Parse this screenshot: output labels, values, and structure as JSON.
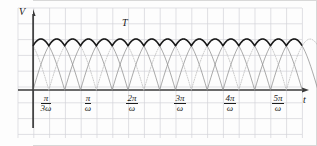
{
  "figure": {
    "background_color": "#fdfdfd",
    "frame_color": "#d8d8d8",
    "grid_color": "#d3d3d8",
    "axis_color": "#3a3a3a",
    "envelope_color": "#1a1a1a",
    "arch_color": "#8e8e8e",
    "dotted_color": "#b5b5b5"
  },
  "axes": {
    "y_label": "V",
    "x_label": "t",
    "period_label": "T"
  },
  "ticks": [
    {
      "id": "tick-pi-over-3w",
      "numerator": "π",
      "denominator": "3ω",
      "x": 46
    },
    {
      "id": "tick-pi-over-w",
      "numerator": "π",
      "denominator": "ω",
      "x": 88
    },
    {
      "id": "tick-2pi-over-w",
      "numerator": "2π",
      "denominator": "ω",
      "x": 132
    },
    {
      "id": "tick-3pi-over-w",
      "numerator": "3π",
      "denominator": "ω",
      "x": 180
    },
    {
      "id": "tick-4pi-over-w",
      "numerator": "4π",
      "denominator": "ω",
      "x": 230
    },
    {
      "id": "tick-5pi-over-w",
      "numerator": "5π",
      "denominator": "ω",
      "x": 278
    }
  ],
  "chart_data": {
    "type": "line",
    "title": "",
    "xlabel": "t",
    "ylabel": "V",
    "grid": true,
    "legend": "none",
    "xlim": [
      0,
      5.6
    ],
    "ylim": [
      0,
      1.15
    ],
    "x_unit": "pi/omega",
    "xticks": [
      0.3333,
      1,
      2,
      3,
      4,
      5
    ],
    "xticklabels": [
      "π/3ω",
      "π/ω",
      "2π/ω",
      "3π/ω",
      "4π/ω",
      "5π/ω"
    ],
    "annotations": [
      {
        "text": "T",
        "x": 1.55,
        "y": 1.08,
        "note": "ripple period marker"
      }
    ],
    "series": [
      {
        "name": "phase-a-rectified",
        "style": "solid-thin",
        "color": "#8e8e8e",
        "formula": "|sin(omega t)|",
        "phase_offset_pi": 0.0,
        "amplitude": 1.0
      },
      {
        "name": "phase-b-rectified",
        "style": "solid-thin",
        "color": "#8e8e8e",
        "formula": "|sin(omega t - 2pi/3)|",
        "phase_offset_pi": 0.6667,
        "amplitude": 1.0
      },
      {
        "name": "phase-c-rectified",
        "style": "dotted-thin",
        "color": "#b5b5b5",
        "formula": "|sin(omega t + 2pi/3)|",
        "phase_offset_pi": 0.3333,
        "amplitude": 1.0
      },
      {
        "name": "output-envelope",
        "style": "solid-thick",
        "color": "#1a1a1a",
        "formula": "max over phases",
        "ripple_min": 0.866,
        "ripple_max": 1.0,
        "ripples_per_pi": 3
      }
    ]
  }
}
